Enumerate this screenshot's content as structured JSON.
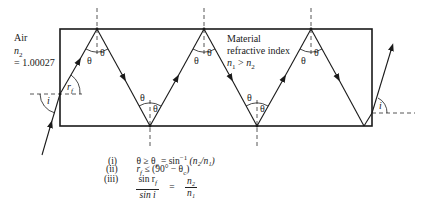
{
  "labels": {
    "air": "Air",
    "air_index_symbol": "n",
    "air_index_sub": "2",
    "air_index_value": "= 1.00027",
    "material_line1": "Material",
    "material_line2": "refractive index",
    "material_relation_n1": "n",
    "material_relation_n1_sub": "1",
    "material_relation_op": " > ",
    "material_relation_n2": "n",
    "material_relation_n2_sub": "2",
    "theta": "θ",
    "incident_angle": "i",
    "refracted_angle": "r",
    "refracted_angle_sub": "f",
    "exit_angle": "i"
  },
  "equations": [
    {
      "num": "(i)",
      "text": "θ ≥ θ",
      "sub": "c",
      "rest": " = sin",
      "sup": "−1",
      "tail": " (n₂/n₁)"
    },
    {
      "num": "(ii)",
      "text": "r",
      "sub": "f",
      "rest": " ≤ (90° − θ",
      "sub2": "c",
      "tail": ")"
    },
    {
      "num": "(iii)",
      "frac1_num": "sin r",
      "frac1_num_sub": "f",
      "frac1_den": "sin i",
      "eq": "=",
      "frac2_num": "n₂",
      "frac2_den": "n₁"
    }
  ],
  "colors": {
    "line": "#1a1a1a",
    "dash": "#444444",
    "background": "#ffffff"
  }
}
